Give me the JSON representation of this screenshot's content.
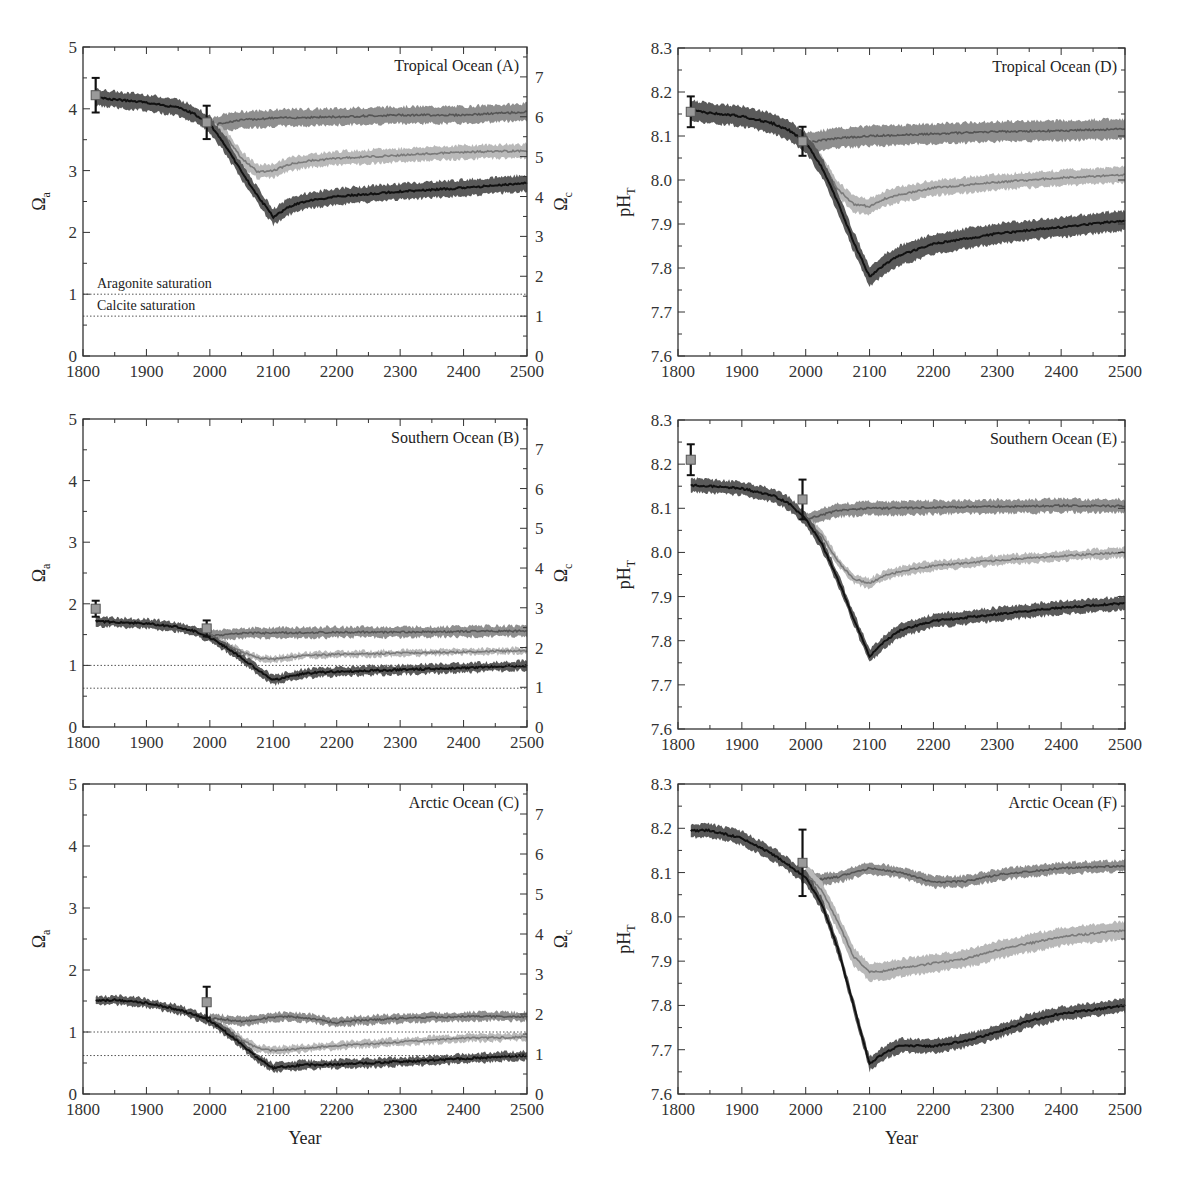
{
  "figure": {
    "x_label": "Year",
    "colors": {
      "high_band": "#5a5a5a",
      "high_line": "#111111",
      "mid_band": "#b9b9b9",
      "mid_line": "#7a7a7a",
      "low_band": "#8f8f8f",
      "low_line": "#555555",
      "obs_marker": "#9a9a9a",
      "axis": "#333333"
    }
  },
  "chart_data": [
    {
      "id": "A",
      "type": "line",
      "title": "Tropical Ocean (A)",
      "xlabel": "",
      "ylabel": "Ωa",
      "ylabel_right": "Ωc",
      "xlim": [
        1800,
        2500
      ],
      "ylim": [
        0,
        5
      ],
      "ylim_right": [
        0,
        7.75
      ],
      "xticks": [
        1800,
        1900,
        2000,
        2100,
        2200,
        2300,
        2400,
        2500
      ],
      "yticks": [
        0,
        1,
        2,
        3,
        4,
        5
      ],
      "yticks_right": [
        0,
        1,
        2,
        3,
        4,
        5,
        6,
        7
      ],
      "hlines": [
        {
          "y": 1.0,
          "label": "Aragonite saturation"
        },
        {
          "y": 0.645,
          "label": "Calcite saturation"
        }
      ],
      "observations": [
        {
          "x": 1820,
          "y": 4.22,
          "err": 0.28
        },
        {
          "x": 1995,
          "y": 3.78,
          "err": 0.27
        }
      ],
      "series": [
        {
          "name": "historical/high",
          "band": "high",
          "x": [
            1820,
            1850,
            1900,
            1950,
            1975,
            2000,
            2025,
            2050,
            2075,
            2100,
            2125,
            2150,
            2200,
            2300,
            2400,
            2500
          ],
          "y": [
            4.18,
            4.15,
            4.1,
            4.02,
            3.92,
            3.75,
            3.4,
            2.98,
            2.6,
            2.25,
            2.42,
            2.5,
            2.58,
            2.66,
            2.72,
            2.8
          ],
          "w": 0.26
        },
        {
          "name": "mid",
          "band": "mid",
          "x": [
            2000,
            2025,
            2050,
            2075,
            2100,
            2125,
            2150,
            2200,
            2300,
            2400,
            2500
          ],
          "y": [
            3.72,
            3.55,
            3.2,
            2.98,
            3.0,
            3.1,
            3.15,
            3.2,
            3.25,
            3.3,
            3.32
          ],
          "w": 0.22
        },
        {
          "name": "low",
          "band": "low",
          "x": [
            2000,
            2025,
            2050,
            2100,
            2150,
            2200,
            2300,
            2400,
            2500
          ],
          "y": [
            3.72,
            3.78,
            3.82,
            3.85,
            3.86,
            3.87,
            3.9,
            3.9,
            3.95
          ],
          "w": 0.27
        }
      ]
    },
    {
      "id": "B",
      "type": "line",
      "title": "Southern Ocean (B)",
      "xlabel": "",
      "ylabel": "Ωa",
      "ylabel_right": "Ωc",
      "xlim": [
        1800,
        2500
      ],
      "ylim": [
        0,
        5
      ],
      "ylim_right": [
        0,
        7.75
      ],
      "xticks": [
        1800,
        1900,
        2000,
        2100,
        2200,
        2300,
        2400,
        2500
      ],
      "yticks": [
        0,
        1,
        2,
        3,
        4,
        5
      ],
      "yticks_right": [
        0,
        1,
        2,
        3,
        4,
        5,
        6,
        7
      ],
      "hlines": [
        {
          "y": 1.0,
          "label": ""
        },
        {
          "y": 0.63,
          "label": ""
        }
      ],
      "observations": [
        {
          "x": 1820,
          "y": 1.92,
          "err": 0.13
        },
        {
          "x": 1995,
          "y": 1.6,
          "err": 0.13
        }
      ],
      "series": [
        {
          "name": "historical/high",
          "band": "high",
          "x": [
            1820,
            1850,
            1900,
            1950,
            1975,
            2000,
            2025,
            2050,
            2075,
            2100,
            2125,
            2150,
            2200,
            2300,
            2400,
            2500
          ],
          "y": [
            1.72,
            1.7,
            1.68,
            1.62,
            1.56,
            1.45,
            1.3,
            1.12,
            0.93,
            0.76,
            0.82,
            0.87,
            0.9,
            0.93,
            0.96,
            1.0
          ],
          "w": 0.15
        },
        {
          "name": "mid",
          "band": "mid",
          "x": [
            2000,
            2025,
            2050,
            2075,
            2100,
            2125,
            2150,
            2200,
            2300,
            2400,
            2500
          ],
          "y": [
            1.45,
            1.35,
            1.22,
            1.12,
            1.1,
            1.13,
            1.16,
            1.18,
            1.2,
            1.22,
            1.24
          ],
          "w": 0.1
        },
        {
          "name": "low",
          "band": "low",
          "x": [
            2000,
            2025,
            2050,
            2100,
            2150,
            2200,
            2300,
            2400,
            2500
          ],
          "y": [
            1.48,
            1.5,
            1.52,
            1.53,
            1.53,
            1.54,
            1.54,
            1.55,
            1.56
          ],
          "w": 0.17
        }
      ]
    },
    {
      "id": "C",
      "type": "line",
      "title": "Arctic Ocean (C)",
      "xlabel": "Year",
      "ylabel": "Ωa",
      "ylabel_right": "Ωc",
      "xlim": [
        1800,
        2500
      ],
      "ylim": [
        0,
        5
      ],
      "ylim_right": [
        0,
        7.75
      ],
      "xticks": [
        1800,
        1900,
        2000,
        2100,
        2200,
        2300,
        2400,
        2500
      ],
      "yticks": [
        0,
        1,
        2,
        3,
        4,
        5
      ],
      "yticks_right": [
        0,
        1,
        2,
        3,
        4,
        5,
        6,
        7
      ],
      "hlines": [
        {
          "y": 1.0,
          "label": ""
        },
        {
          "y": 0.62,
          "label": ""
        }
      ],
      "observations": [
        {
          "x": 1995,
          "y": 1.48,
          "err": 0.25
        }
      ],
      "series": [
        {
          "name": "historical/high",
          "band": "high",
          "x": [
            1820,
            1850,
            1900,
            1950,
            1975,
            2000,
            2025,
            2050,
            2075,
            2100,
            2125,
            2150,
            2200,
            2300,
            2400,
            2500
          ],
          "y": [
            1.5,
            1.52,
            1.47,
            1.36,
            1.28,
            1.18,
            1.0,
            0.8,
            0.58,
            0.42,
            0.45,
            0.47,
            0.48,
            0.52,
            0.57,
            0.62
          ],
          "w": 0.14
        },
        {
          "name": "mid",
          "band": "mid",
          "x": [
            2000,
            2025,
            2050,
            2075,
            2100,
            2125,
            2150,
            2200,
            2300,
            2400,
            2500
          ],
          "y": [
            1.2,
            1.05,
            0.88,
            0.74,
            0.7,
            0.72,
            0.74,
            0.78,
            0.84,
            0.9,
            0.92
          ],
          "w": 0.12
        },
        {
          "name": "low",
          "band": "low",
          "x": [
            2000,
            2025,
            2050,
            2075,
            2100,
            2125,
            2150,
            2200,
            2225,
            2300,
            2400,
            2500
          ],
          "y": [
            1.22,
            1.2,
            1.17,
            1.2,
            1.24,
            1.25,
            1.23,
            1.15,
            1.18,
            1.22,
            1.25,
            1.25
          ],
          "w": 0.14
        }
      ]
    },
    {
      "id": "D",
      "type": "line",
      "title": "Tropical Ocean (D)",
      "xlabel": "",
      "ylabel": "pHT",
      "xlim": [
        1800,
        2500
      ],
      "ylim": [
        7.6,
        8.3
      ],
      "xticks": [
        1800,
        1900,
        2000,
        2100,
        2200,
        2300,
        2400,
        2500
      ],
      "yticks": [
        7.6,
        7.7,
        7.8,
        7.9,
        8.0,
        8.1,
        8.2,
        8.3
      ],
      "observations": [
        {
          "x": 1820,
          "y": 8.155,
          "err": 0.035
        },
        {
          "x": 1995,
          "y": 8.088,
          "err": 0.033
        }
      ],
      "series": [
        {
          "name": "historical/high",
          "band": "high",
          "x": [
            1820,
            1850,
            1900,
            1950,
            1975,
            2000,
            2025,
            2050,
            2075,
            2100,
            2125,
            2150,
            2200,
            2300,
            2400,
            2500
          ],
          "y": [
            8.158,
            8.152,
            8.145,
            8.128,
            8.112,
            8.085,
            8.03,
            7.95,
            7.86,
            7.78,
            7.81,
            7.83,
            7.855,
            7.878,
            7.893,
            7.908
          ],
          "w": 0.045
        },
        {
          "name": "mid",
          "band": "mid",
          "x": [
            2000,
            2025,
            2050,
            2075,
            2100,
            2125,
            2150,
            2200,
            2300,
            2400,
            2500
          ],
          "y": [
            8.085,
            8.04,
            7.98,
            7.945,
            7.94,
            7.958,
            7.968,
            7.982,
            7.995,
            8.005,
            8.012
          ],
          "w": 0.035
        },
        {
          "name": "low",
          "band": "low",
          "x": [
            2000,
            2025,
            2050,
            2100,
            2150,
            2200,
            2300,
            2400,
            2500
          ],
          "y": [
            8.085,
            8.09,
            8.095,
            8.1,
            8.102,
            8.105,
            8.11,
            8.112,
            8.116
          ],
          "w": 0.045
        }
      ]
    },
    {
      "id": "E",
      "type": "line",
      "title": "Southern Ocean (E)",
      "xlabel": "",
      "ylabel": "pHT",
      "xlim": [
        1800,
        2500
      ],
      "ylim": [
        7.6,
        8.3
      ],
      "xticks": [
        1800,
        1900,
        2000,
        2100,
        2200,
        2300,
        2400,
        2500
      ],
      "yticks": [
        7.6,
        7.7,
        7.8,
        7.9,
        8.0,
        8.1,
        8.2,
        8.3
      ],
      "observations": [
        {
          "x": 1820,
          "y": 8.21,
          "err": 0.035
        },
        {
          "x": 1995,
          "y": 8.12,
          "err": 0.045
        }
      ],
      "series": [
        {
          "name": "historical/high",
          "band": "high",
          "x": [
            1820,
            1850,
            1900,
            1950,
            1975,
            2000,
            2025,
            2050,
            2075,
            2100,
            2125,
            2150,
            2200,
            2300,
            2400,
            2500
          ],
          "y": [
            8.152,
            8.15,
            8.145,
            8.128,
            8.11,
            8.075,
            8.02,
            7.94,
            7.85,
            7.765,
            7.8,
            7.825,
            7.845,
            7.86,
            7.875,
            7.885
          ],
          "w": 0.03
        },
        {
          "name": "mid",
          "band": "mid",
          "x": [
            2000,
            2025,
            2050,
            2075,
            2100,
            2125,
            2150,
            2200,
            2300,
            2400,
            2500
          ],
          "y": [
            8.075,
            8.04,
            7.98,
            7.94,
            7.93,
            7.948,
            7.958,
            7.97,
            7.982,
            7.992,
            8.0
          ],
          "w": 0.022
        },
        {
          "name": "low",
          "band": "low",
          "x": [
            2000,
            2025,
            2050,
            2100,
            2150,
            2200,
            2300,
            2400,
            2500
          ],
          "y": [
            8.075,
            8.085,
            8.095,
            8.1,
            8.1,
            8.102,
            8.104,
            8.106,
            8.105
          ],
          "w": 0.03
        }
      ]
    },
    {
      "id": "F",
      "type": "line",
      "title": "Arctic Ocean (F)",
      "xlabel": "Year",
      "ylabel": "pHT",
      "xlim": [
        1800,
        2500
      ],
      "ylim": [
        7.6,
        8.3
      ],
      "xticks": [
        1800,
        1900,
        2000,
        2100,
        2200,
        2300,
        2400,
        2500
      ],
      "yticks": [
        7.6,
        7.7,
        7.8,
        7.9,
        8.0,
        8.1,
        8.2,
        8.3
      ],
      "observations": [
        {
          "x": 1995,
          "y": 8.122,
          "err": 0.075
        }
      ],
      "series": [
        {
          "name": "historical/high",
          "band": "high",
          "x": [
            1820,
            1850,
            1900,
            1950,
            1975,
            2000,
            2025,
            2050,
            2075,
            2100,
            2125,
            2150,
            2200,
            2250,
            2300,
            2350,
            2400,
            2450,
            2500
          ],
          "y": [
            8.195,
            8.195,
            8.178,
            8.14,
            8.115,
            8.088,
            8.03,
            7.93,
            7.8,
            7.668,
            7.695,
            7.71,
            7.708,
            7.72,
            7.74,
            7.765,
            7.782,
            7.79,
            7.8
          ],
          "w": 0.03
        },
        {
          "name": "mid",
          "band": "mid",
          "x": [
            2000,
            2025,
            2050,
            2075,
            2100,
            2125,
            2150,
            2200,
            2250,
            2300,
            2400,
            2500
          ],
          "y": [
            8.1,
            8.06,
            7.99,
            7.91,
            7.875,
            7.878,
            7.885,
            7.895,
            7.905,
            7.925,
            7.955,
            7.97
          ],
          "w": 0.04
        },
        {
          "name": "low",
          "band": "low",
          "x": [
            2000,
            2025,
            2050,
            2100,
            2150,
            2200,
            2250,
            2300,
            2400,
            2500
          ],
          "y": [
            8.095,
            8.085,
            8.09,
            8.11,
            8.1,
            8.078,
            8.08,
            8.095,
            8.11,
            8.115
          ],
          "w": 0.025
        }
      ]
    }
  ],
  "layout": {
    "panels": [
      {
        "id": "A",
        "left": 83,
        "top": 47,
        "right": 527,
        "bottom": 356,
        "right_axis": true
      },
      {
        "id": "B",
        "left": 83,
        "top": 419,
        "right": 527,
        "bottom": 727,
        "right_axis": true
      },
      {
        "id": "C",
        "left": 83,
        "top": 784,
        "right": 527,
        "bottom": 1094,
        "right_axis": true
      },
      {
        "id": "D",
        "left": 678,
        "top": 48,
        "right": 1125,
        "bottom": 356,
        "right_axis": false
      },
      {
        "id": "E",
        "left": 678,
        "top": 420,
        "right": 1125,
        "bottom": 729,
        "right_axis": false
      },
      {
        "id": "F",
        "left": 678,
        "top": 784,
        "right": 1125,
        "bottom": 1094,
        "right_axis": false
      }
    ]
  }
}
